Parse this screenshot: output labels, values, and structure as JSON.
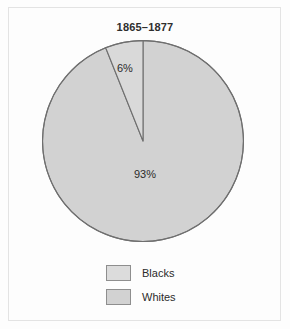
{
  "figure": {
    "title": "1865–1877",
    "background_color": "#fdfdfd",
    "frame_color": "#e3e3e3"
  },
  "chart_data": {
    "type": "pie",
    "title": "1865–1877",
    "xlabel": "",
    "ylabel": "",
    "grid": false,
    "legend_position": "bottom",
    "start_angle_deg": 90,
    "direction": "counterclockwise",
    "categories": [
      "Blacks",
      "Whites"
    ],
    "values": [
      6,
      93
    ],
    "labels": [
      "6%",
      "93%"
    ],
    "slices": [
      {
        "name": "Blacks",
        "value": 6,
        "label": "6%",
        "fill": "#d9d9d9",
        "stroke": "#6f6f6f"
      },
      {
        "name": "Whites",
        "value": 93,
        "label": "93%",
        "fill": "#d2d2d2",
        "stroke": "#6f6f6f"
      }
    ],
    "legend": [
      {
        "label": "Blacks",
        "swatch_fill": "#dcdcdc",
        "swatch_stroke": "#8e8e8e"
      },
      {
        "label": "Whites",
        "swatch_fill": "#d2d2d2",
        "swatch_stroke": "#8e8e8e"
      }
    ]
  }
}
